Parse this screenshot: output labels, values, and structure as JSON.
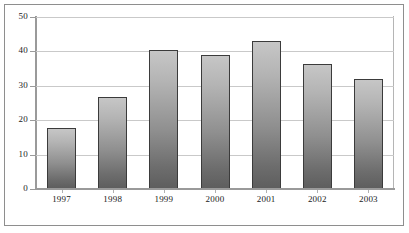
{
  "chart_data": {
    "type": "bar",
    "title": "",
    "subtitle": "",
    "xlabel": "",
    "ylabel": "",
    "categories": [
      "1997",
      "1998",
      "1999",
      "2000",
      "2001",
      "2002",
      "2003"
    ],
    "values": [
      17.7,
      26.8,
      40.5,
      39.0,
      43.0,
      36.2,
      32.1
    ],
    "series": [
      {
        "name": "",
        "values": [
          17.7,
          26.8,
          40.5,
          39.0,
          43.0,
          36.2,
          32.1
        ]
      }
    ],
    "ylim": [
      0,
      50
    ],
    "yticks": [
      0,
      10,
      20,
      30,
      40,
      50
    ],
    "ytick_labels": [
      "0",
      "10",
      "20",
      "30",
      "40",
      "50"
    ],
    "grid": true,
    "grid_axis": "y",
    "legend": false,
    "legend_position": "none",
    "bar_fill": "#9a9a9a",
    "bar_edge_color": "#3b3b3b",
    "grid_color": "#c9c9c9",
    "axis_color": "#9a9a9a",
    "frame_border_color": "#8e8e8e",
    "background": "#ffffff"
  }
}
